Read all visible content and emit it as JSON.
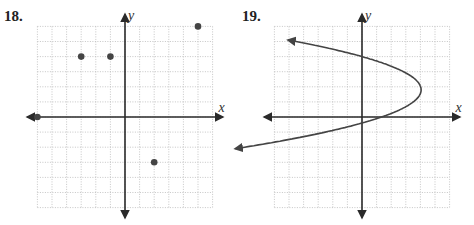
{
  "problems": [
    {
      "number": "18.",
      "x_axis_label": "x",
      "y_axis_label": "y"
    },
    {
      "number": "19.",
      "x_axis_label": "x",
      "y_axis_label": "y"
    }
  ],
  "colors": {
    "axis": "#2a2a2a",
    "grid": "#b8b8b8",
    "point": "#444444",
    "curve": "#444444"
  },
  "chart_data": [
    {
      "type": "scatter",
      "title": "18.",
      "xlabel": "x",
      "ylabel": "y",
      "xlim": [
        -6,
        6
      ],
      "ylim": [
        -6,
        6
      ],
      "grid": true,
      "grid_step": 1,
      "points": [
        {
          "x": -3,
          "y": 4
        },
        {
          "x": -1,
          "y": 4
        },
        {
          "x": 5,
          "y": 6
        },
        {
          "x": -6,
          "y": 0
        },
        {
          "x": 2,
          "y": -3
        }
      ]
    },
    {
      "type": "line",
      "title": "19.",
      "xlabel": "x",
      "ylabel": "y",
      "xlim": [
        -6,
        6
      ],
      "ylim": [
        -6,
        6
      ],
      "grid": true,
      "grid_step": 1,
      "curve": "parabola opening left",
      "vertex": {
        "x": 4,
        "y": 2
      },
      "y_intercepts": [
        4,
        -0.5
      ],
      "x_intercept": 1,
      "arrow_ends": [
        {
          "x": -5.8,
          "y": 5.1
        },
        {
          "x": -5.8,
          "y": -2.1
        }
      ]
    }
  ]
}
